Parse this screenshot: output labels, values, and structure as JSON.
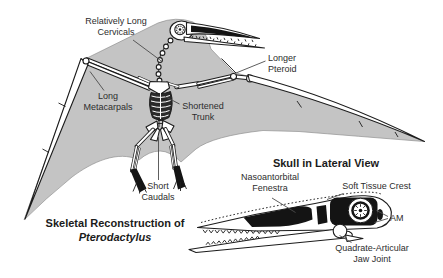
{
  "figure": {
    "main_caption": {
      "line1": "Skeletal Reconstruction of",
      "line2": "Pterodactylus"
    },
    "skull_caption": "Skull in Lateral View"
  },
  "labels": {
    "relatively_long_cervicals": "Relatively Long\nCervicals",
    "longer_pteroid": "Longer\nPteroid",
    "long_metacarpals": "Long\nMetacarpals",
    "shortened_trunk": "Shortened\nTrunk",
    "short_caudals": "Short\nCaudals",
    "nasoantorbital_fenestra": "Nasoantorbital\nFenestra",
    "soft_tissue_crest": "Soft Tissue Crest",
    "am": "AM",
    "quadrate_articular_jaw_joint": "Quadrate-Articular\nJaw Joint"
  },
  "colors": {
    "membrane": "#c4c4c4",
    "bone_outline": "#1c1c1c",
    "text": "#2d2d2d",
    "background": "#ffffff"
  }
}
